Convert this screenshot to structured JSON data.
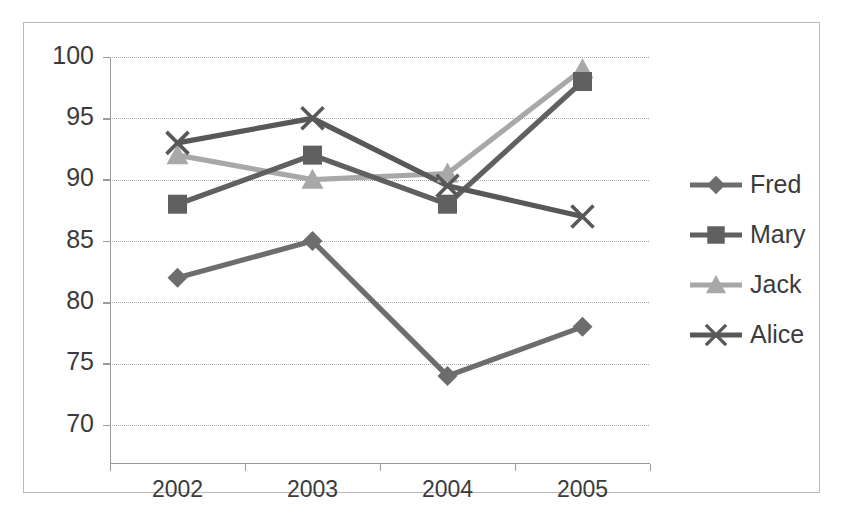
{
  "chart_data": {
    "type": "line",
    "title": "",
    "subtitle": "",
    "xlabel": "",
    "ylabel": "",
    "categories": [
      "2002",
      "2003",
      "2004",
      "2005"
    ],
    "ylim": [
      70,
      100
    ],
    "yticks": [
      70,
      75,
      80,
      85,
      90,
      95,
      100
    ],
    "grid": true,
    "legend_position": "right",
    "series": [
      {
        "name": "Fred",
        "marker": "diamond",
        "color": "#6d6d6d",
        "values": [
          82,
          85,
          74,
          78
        ]
      },
      {
        "name": "Mary",
        "marker": "square",
        "color": "#606060",
        "values": [
          88,
          92,
          88,
          98
        ]
      },
      {
        "name": "Jack",
        "marker": "triangle",
        "color": "#a8a8a8",
        "values": [
          92,
          90,
          90.5,
          99
        ]
      },
      {
        "name": "Alice",
        "marker": "cross",
        "color": "#585858",
        "values": [
          93,
          95,
          89.5,
          87
        ]
      }
    ]
  },
  "axes": {
    "y_tick_labels": [
      "100",
      "95",
      "90",
      "85",
      "80",
      "75",
      "70"
    ],
    "x_tick_labels": [
      "2002",
      "2003",
      "2004",
      "2005"
    ]
  },
  "legend": {
    "entries": [
      {
        "label": "Fred",
        "marker": "diamond-marker-icon"
      },
      {
        "label": "Mary",
        "marker": "square-marker-icon"
      },
      {
        "label": "Jack",
        "marker": "triangle-marker-icon"
      },
      {
        "label": "Alice",
        "marker": "cross-marker-icon"
      }
    ]
  },
  "colors": {
    "border": "#b9b9b9",
    "gridline": "#a6a6a6",
    "axis": "#9a9a9a",
    "text": "#3b3b3b",
    "background": "#ffffff"
  }
}
